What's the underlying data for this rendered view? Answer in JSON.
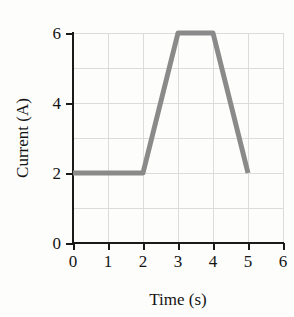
{
  "chart_data": {
    "type": "line",
    "title": "",
    "xlabel": "Time (s)",
    "ylabel": "Current (A)",
    "xlim": [
      0,
      6
    ],
    "ylim": [
      0,
      6
    ],
    "grid": true,
    "legend": "none",
    "xticks": [
      "0",
      "1",
      "2",
      "3",
      "4",
      "5",
      "6"
    ],
    "xtick_values": [
      0,
      1,
      2,
      3,
      4,
      5,
      6
    ],
    "yticks": [
      "0",
      "2",
      "4",
      "6"
    ],
    "ytick_values": [
      0,
      2,
      4,
      6
    ],
    "gridlines_x": [
      0,
      1,
      2,
      3,
      4,
      5,
      6
    ],
    "gridlines_y": [
      0,
      1,
      2,
      3,
      4,
      5,
      6
    ],
    "series": [
      {
        "name": "Current",
        "color": "#8a8a8a",
        "x": [
          0,
          2,
          3,
          4,
          5
        ],
        "values": [
          2,
          2,
          6,
          6,
          2
        ],
        "points": [
          {
            "x": 0,
            "y": 2
          },
          {
            "x": 2,
            "y": 2
          },
          {
            "x": 3,
            "y": 6
          },
          {
            "x": 4,
            "y": 6
          },
          {
            "x": 5,
            "y": 2
          }
        ]
      }
    ]
  },
  "colors": {
    "background": "#fdfdfb",
    "axis": "#1a1a1a",
    "grid": "#dcdcdc",
    "trace": "#8a8a8a",
    "text": "#141414"
  }
}
